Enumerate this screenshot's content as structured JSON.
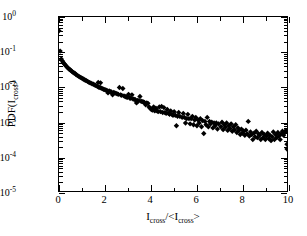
{
  "figure": {
    "background_color": "#ffffff",
    "frame_color": "#000000",
    "marker_color": "#000000"
  },
  "axes": {
    "x": {
      "title_parts": {
        "main": "I",
        "sub1": "cross",
        "slash": "/<I",
        "sub2": "cross",
        "close": ">"
      },
      "title_text": "Icross/<Icross>",
      "scale": "linear",
      "min": 0,
      "max": 10,
      "major_ticks": [
        0,
        2,
        4,
        6,
        8,
        10
      ],
      "minor_ticks": [
        1,
        3,
        5,
        7,
        9
      ],
      "tick_labels": [
        "0",
        "2",
        "4",
        "6",
        "8",
        "10"
      ]
    },
    "y": {
      "title_parts": {
        "main": "PDF(I",
        "sub": "cross",
        "close": ")"
      },
      "title_text": "PDF(Icross)",
      "scale": "log10",
      "min": 1e-05,
      "max": 1,
      "major_ticks": [
        1,
        0.1,
        0.01,
        0.001,
        0.0001,
        1e-05
      ],
      "tick_label_mantissa": "10",
      "tick_label_exponents": [
        "0",
        "-1",
        "-2",
        "-3",
        "-4",
        "-5"
      ]
    }
  },
  "chart_data": {
    "type": "scatter",
    "title": "",
    "xlabel": "Icross/<Icross>",
    "ylabel": "PDF(Icross)",
    "xlim": [
      0,
      10
    ],
    "ylim": [
      1e-05,
      1
    ],
    "yscale": "log",
    "xscale": "linear",
    "grid": false,
    "legend": false,
    "marker": "diamond",
    "marker_color": "#000000",
    "marker_size_px": 4.2,
    "series": [
      {
        "name": "PDF of crossing intensity",
        "points": [
          [
            0.0,
            0.4
          ],
          [
            0.05,
            0.105
          ],
          [
            0.1,
            0.062
          ],
          [
            0.14,
            0.055
          ],
          [
            0.18,
            0.05
          ],
          [
            0.22,
            0.046
          ],
          [
            0.26,
            0.043
          ],
          [
            0.3,
            0.04
          ],
          [
            0.34,
            0.037
          ],
          [
            0.38,
            0.035
          ],
          [
            0.42,
            0.033
          ],
          [
            0.46,
            0.031
          ],
          [
            0.5,
            0.03
          ],
          [
            0.55,
            0.028
          ],
          [
            0.6,
            0.026
          ],
          [
            0.65,
            0.025
          ],
          [
            0.7,
            0.024
          ],
          [
            0.75,
            0.022
          ],
          [
            0.8,
            0.021
          ],
          [
            0.85,
            0.02
          ],
          [
            0.9,
            0.019
          ],
          [
            0.95,
            0.0185
          ],
          [
            1.0,
            0.0175
          ],
          [
            1.05,
            0.0168
          ],
          [
            1.1,
            0.016
          ],
          [
            1.15,
            0.0152
          ],
          [
            1.2,
            0.0148
          ],
          [
            1.25,
            0.0142
          ],
          [
            1.3,
            0.0135
          ],
          [
            1.35,
            0.013
          ],
          [
            1.4,
            0.0126
          ],
          [
            1.45,
            0.012
          ],
          [
            1.5,
            0.0118
          ],
          [
            1.55,
            0.0112
          ],
          [
            1.6,
            0.0108
          ],
          [
            1.65,
            0.0105
          ],
          [
            1.7,
            0.01
          ],
          [
            1.72,
            0.0132
          ],
          [
            1.75,
            0.0096
          ],
          [
            1.8,
            0.0094
          ],
          [
            1.82,
            0.0128
          ],
          [
            1.85,
            0.009
          ],
          [
            1.9,
            0.0087
          ],
          [
            1.95,
            0.0084
          ],
          [
            2.0,
            0.0082
          ],
          [
            2.05,
            0.008
          ],
          [
            2.1,
            0.0078
          ],
          [
            2.15,
            0.0066
          ],
          [
            2.2,
            0.0075
          ],
          [
            2.25,
            0.0072
          ],
          [
            2.3,
            0.007
          ],
          [
            2.35,
            0.0058
          ],
          [
            2.4,
            0.0068
          ],
          [
            2.45,
            0.0066
          ],
          [
            2.5,
            0.0064
          ],
          [
            2.55,
            0.0062
          ],
          [
            2.6,
            0.006
          ],
          [
            2.65,
            0.0094
          ],
          [
            2.7,
            0.0058
          ],
          [
            2.75,
            0.0056
          ],
          [
            2.8,
            0.0088
          ],
          [
            2.85,
            0.0054
          ],
          [
            2.9,
            0.0052
          ],
          [
            2.95,
            0.005
          ],
          [
            3.0,
            0.0049
          ],
          [
            3.05,
            0.006
          ],
          [
            3.1,
            0.0047
          ],
          [
            3.15,
            0.0046
          ],
          [
            3.2,
            0.0058
          ],
          [
            3.25,
            0.0044
          ],
          [
            3.3,
            0.0043
          ],
          [
            3.35,
            0.0042
          ],
          [
            3.4,
            0.0034
          ],
          [
            3.45,
            0.004
          ],
          [
            3.5,
            0.0039
          ],
          [
            3.55,
            0.0052
          ],
          [
            3.6,
            0.0038
          ],
          [
            3.65,
            0.0037
          ],
          [
            3.7,
            0.0036
          ],
          [
            3.75,
            0.0035
          ],
          [
            3.8,
            0.003
          ],
          [
            3.85,
            0.0034
          ],
          [
            3.9,
            0.0033
          ],
          [
            3.95,
            0.0026
          ],
          [
            4.0,
            0.0024
          ],
          [
            4.05,
            0.0022
          ],
          [
            4.1,
            0.0021
          ],
          [
            4.15,
            0.0026
          ],
          [
            4.2,
            0.002
          ],
          [
            4.25,
            0.0024
          ],
          [
            4.3,
            0.002
          ],
          [
            4.35,
            0.0019
          ],
          [
            4.4,
            0.0026
          ],
          [
            4.45,
            0.0019
          ],
          [
            4.5,
            0.0027
          ],
          [
            4.55,
            0.0018
          ],
          [
            4.6,
            0.0025
          ],
          [
            4.65,
            0.0018
          ],
          [
            4.7,
            0.0017
          ],
          [
            4.75,
            0.0022
          ],
          [
            4.8,
            0.0017
          ],
          [
            4.85,
            0.0016
          ],
          [
            4.9,
            0.002
          ],
          [
            4.95,
            0.0016
          ],
          [
            5.0,
            0.0015
          ],
          [
            5.05,
            0.0019
          ],
          [
            5.1,
            0.0015
          ],
          [
            5.15,
            0.00075
          ],
          [
            5.2,
            0.0014
          ],
          [
            5.25,
            0.0018
          ],
          [
            5.3,
            0.0014
          ],
          [
            5.4,
            0.0013
          ],
          [
            5.45,
            0.0017
          ],
          [
            5.5,
            0.0013
          ],
          [
            5.55,
            0.0009
          ],
          [
            5.6,
            0.0012
          ],
          [
            5.65,
            0.0016
          ],
          [
            5.7,
            0.0012
          ],
          [
            5.75,
            0.00085
          ],
          [
            5.8,
            0.0012
          ],
          [
            5.85,
            0.0014
          ],
          [
            5.9,
            0.0008
          ],
          [
            5.95,
            0.0011
          ],
          [
            6.0,
            0.0013
          ],
          [
            6.05,
            0.00075
          ],
          [
            6.1,
            0.0011
          ],
          [
            6.15,
            0.0009
          ],
          [
            6.2,
            0.0012
          ],
          [
            6.25,
            0.0007
          ],
          [
            6.3,
            0.00105
          ],
          [
            6.35,
            0.00045
          ],
          [
            6.4,
            0.001
          ],
          [
            6.45,
            0.0008
          ],
          [
            6.5,
            0.0013
          ],
          [
            6.55,
            0.0007
          ],
          [
            6.6,
            0.001
          ],
          [
            6.65,
            0.00085
          ],
          [
            6.7,
            0.00095
          ],
          [
            6.75,
            0.00065
          ],
          [
            6.8,
            0.0009
          ],
          [
            6.85,
            0.00075
          ],
          [
            6.9,
            0.0009
          ],
          [
            6.95,
            0.0006
          ],
          [
            7.0,
            0.00085
          ],
          [
            7.1,
            0.0007
          ],
          [
            7.15,
            0.00095
          ],
          [
            7.2,
            0.00058
          ],
          [
            7.25,
            0.0008
          ],
          [
            7.3,
            0.00068
          ],
          [
            7.35,
            0.0009
          ],
          [
            7.4,
            0.00055
          ],
          [
            7.45,
            0.00075
          ],
          [
            7.5,
            0.00062
          ],
          [
            7.55,
            0.00085
          ],
          [
            7.6,
            0.00052
          ],
          [
            7.65,
            0.0007
          ],
          [
            7.7,
            0.00058
          ],
          [
            7.75,
            0.0008
          ],
          [
            7.8,
            0.00048
          ],
          [
            7.85,
            0.00065
          ],
          [
            7.9,
            0.00055
          ],
          [
            7.95,
            0.00042
          ],
          [
            8.0,
            0.0006
          ],
          [
            8.05,
            0.00046
          ],
          [
            8.1,
            0.00052
          ],
          [
            8.15,
            0.0004
          ],
          [
            8.2,
            0.00056
          ],
          [
            8.25,
            0.00044
          ],
          [
            8.3,
            0.001
          ],
          [
            8.35,
            0.00038
          ],
          [
            8.4,
            0.0005
          ],
          [
            8.45,
            0.00042
          ],
          [
            8.5,
            0.0003
          ],
          [
            8.55,
            0.00046
          ],
          [
            8.6,
            0.00036
          ],
          [
            8.65,
            0.00052
          ],
          [
            8.7,
            0.00034
          ],
          [
            8.75,
            0.00044
          ],
          [
            8.8,
            0.0004
          ],
          [
            8.85,
            0.0003
          ],
          [
            8.9,
            0.00048
          ],
          [
            8.95,
            0.00034
          ],
          [
            9.0,
            0.00042
          ],
          [
            9.05,
            0.0003
          ],
          [
            9.1,
            0.00038
          ],
          [
            9.15,
            0.00046
          ],
          [
            9.2,
            0.00032
          ],
          [
            9.25,
            0.0004
          ],
          [
            9.3,
            0.00028
          ],
          [
            9.35,
            0.00036
          ],
          [
            9.4,
            0.0005
          ],
          [
            9.45,
            0.0003
          ],
          [
            9.5,
            0.00042
          ],
          [
            9.55,
            0.00034
          ],
          [
            9.6,
            0.00048
          ],
          [
            9.65,
            0.00038
          ],
          [
            9.7,
            0.0003
          ],
          [
            9.75,
            0.00044
          ],
          [
            9.8,
            0.00052
          ],
          [
            9.85,
            0.0004
          ],
          [
            9.9,
            0.00048
          ],
          [
            9.95,
            0.00055
          ],
          [
            10.0,
            0.00022
          ],
          [
            10.0,
            0.00016
          ]
        ]
      }
    ]
  }
}
